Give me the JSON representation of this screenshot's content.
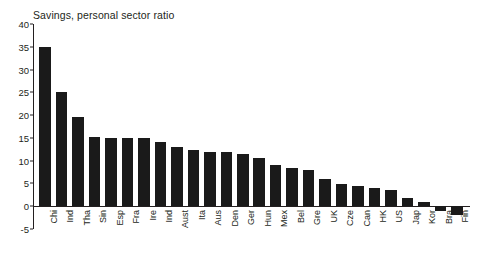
{
  "chart_data": {
    "type": "bar",
    "title": "Savings, personal sector ratio",
    "xlabel": "",
    "ylabel": "",
    "ylim": [
      -5,
      40
    ],
    "ytick_values": [
      40,
      35,
      30,
      25,
      20,
      15,
      10,
      5,
      0,
      -5
    ],
    "ytick_labels": [
      "40",
      "35",
      "30",
      "25",
      "20",
      "15",
      "10",
      "5",
      "0",
      "-5"
    ],
    "grid": false,
    "legend": null,
    "bar_color": "#1a1a1a",
    "axis_color": "#231f20",
    "categories": [
      "Chi",
      "Ind",
      "Tha",
      "Sin",
      "Esp",
      "Fra",
      "Ire",
      "Ind",
      "Aust",
      "Ita",
      "Aus",
      "Den",
      "Ger",
      "Hun",
      "Mex",
      "Bel",
      "Gre",
      "UK",
      "Cze",
      "Can",
      "HK",
      "US",
      "Jap",
      "Kor",
      "Bra",
      "Fin"
    ],
    "values": [
      35.0,
      25.0,
      19.5,
      15.2,
      15.0,
      15.0,
      15.0,
      14.0,
      13.0,
      12.3,
      12.0,
      11.8,
      11.5,
      10.5,
      9.0,
      8.5,
      8.0,
      6.0,
      4.8,
      4.5,
      4.0,
      3.5,
      1.8,
      1.0,
      -1.0,
      -2.0
    ]
  }
}
